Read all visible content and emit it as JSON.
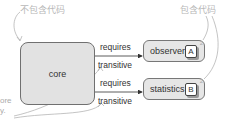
{
  "annotations": {
    "no_code": "不包含代码",
    "has_code": "包含代码",
    "partial_left_1": "ore",
    "partial_left_2": "y."
  },
  "nodes": {
    "core": {
      "label": "core"
    },
    "observer": {
      "label": "observer",
      "badge": "A",
      "corner": "2"
    },
    "statistics": {
      "label": "statistics",
      "badge": "B",
      "corner": "2"
    }
  },
  "edges": [
    {
      "from": "core",
      "to": "observer",
      "label": "requires",
      "modifier": "transitive"
    },
    {
      "from": "core",
      "to": "statistics",
      "label": "requires",
      "modifier": "transitive"
    }
  ],
  "colors": {
    "box_fill": "#e2e2e2",
    "box_border": "#707070",
    "annotation": "#b8b8b8",
    "line": "#333333"
  }
}
